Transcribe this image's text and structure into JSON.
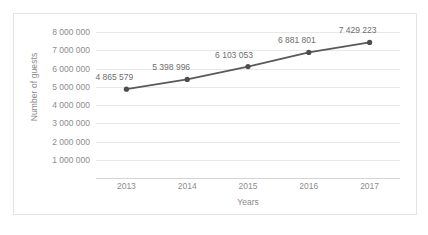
{
  "chart_data": {
    "type": "line",
    "title": "",
    "xlabel": "Years",
    "ylabel": "Number of guests",
    "categories": [
      "2013",
      "2014",
      "2015",
      "2016",
      "2017"
    ],
    "values": [
      4865579,
      5398996,
      6103053,
      6881801,
      7429223
    ],
    "point_labels": [
      "4 865 579",
      "5 398 996",
      "6 103 053",
      "6 881 801",
      "7 429 223"
    ],
    "ylim": [
      0,
      8000000
    ],
    "ytick_values": [
      0,
      1000000,
      2000000,
      3000000,
      4000000,
      5000000,
      6000000,
      7000000,
      8000000
    ],
    "ytick_labels": [
      "",
      "1 000 000",
      "2 000 000",
      "3 000 000",
      "4 000 000",
      "5 000 000",
      "6 000 000",
      "7 000 000",
      "8 000 000"
    ],
    "grid": true,
    "legend": false,
    "series": [
      {
        "name": "Number of guests",
        "values": [
          4865579,
          5398996,
          6103053,
          6881801,
          7429223
        ],
        "color": "#5a5a5a",
        "marker": "circle"
      }
    ],
    "colors": {
      "line": "#595959",
      "marker": "#4d4d4d",
      "gridline": "#e8e8e8",
      "axis": "#d4d4d4",
      "tick_text": "#8d8d8d",
      "axis_title": "#8a8a8a",
      "label_text": "#6e6e6e",
      "frame": "#e3e3e3",
      "background": "#ffffff"
    }
  }
}
